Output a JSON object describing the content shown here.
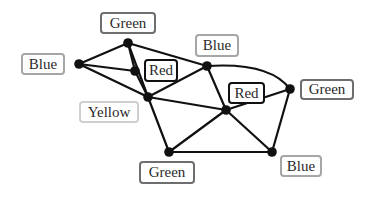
{
  "diagram": {
    "type": "graph-coloring",
    "colors": {
      "edge": "#111111",
      "node": "#111111",
      "border_red": "#111111",
      "border_green": "#6e6e6e",
      "border_blue": "#a6a6a6",
      "border_yellow": "#cfcfcf"
    },
    "nodes": [
      {
        "id": "A",
        "x": 79,
        "y": 64,
        "color": "Blue"
      },
      {
        "id": "B",
        "x": 128,
        "y": 43,
        "color": "Green"
      },
      {
        "id": "C",
        "x": 135,
        "y": 71,
        "color": "Red"
      },
      {
        "id": "D",
        "x": 148,
        "y": 97,
        "color": "Yellow"
      },
      {
        "id": "E",
        "x": 207,
        "y": 66,
        "color": "Blue"
      },
      {
        "id": "F",
        "x": 226,
        "y": 110,
        "color": "Red"
      },
      {
        "id": "G",
        "x": 290,
        "y": 89,
        "color": "Green"
      },
      {
        "id": "H",
        "x": 169,
        "y": 152,
        "color": "Green"
      },
      {
        "id": "I",
        "x": 272,
        "y": 152,
        "color": "Blue"
      }
    ],
    "edges": [
      [
        "A",
        "B"
      ],
      [
        "A",
        "C"
      ],
      [
        "A",
        "D"
      ],
      [
        "B",
        "C"
      ],
      [
        "B",
        "D"
      ],
      [
        "B",
        "E"
      ],
      [
        "C",
        "D"
      ],
      [
        "D",
        "E"
      ],
      [
        "D",
        "F"
      ],
      [
        "D",
        "H"
      ],
      [
        "E",
        "F"
      ],
      [
        "E",
        "G"
      ],
      [
        "F",
        "G"
      ],
      [
        "F",
        "H"
      ],
      [
        "F",
        "I"
      ],
      [
        "G",
        "I"
      ],
      [
        "H",
        "I"
      ]
    ],
    "labels": [
      {
        "node": "A",
        "text": "Blue",
        "x": 21,
        "y": 53,
        "w": 44,
        "h": 22,
        "border": "#a6a6a6",
        "bw": 2
      },
      {
        "node": "B",
        "text": "Green",
        "x": 100,
        "y": 12,
        "w": 56,
        "h": 22,
        "border": "#6e6e6e",
        "bw": 2
      },
      {
        "node": "C",
        "text": "Red",
        "x": 144,
        "y": 59,
        "w": 34,
        "h": 23,
        "border": "#111111",
        "bw": 2
      },
      {
        "node": "D",
        "text": "Yellow",
        "x": 79,
        "y": 101,
        "w": 60,
        "h": 22,
        "border": "#cfcfcf",
        "bw": 2
      },
      {
        "node": "E",
        "text": "Blue",
        "x": 195,
        "y": 34,
        "w": 44,
        "h": 23,
        "border": "#a6a6a6",
        "bw": 2
      },
      {
        "node": "F",
        "text": "Red",
        "x": 228,
        "y": 82,
        "w": 37,
        "h": 22,
        "border": "#111111",
        "bw": 2
      },
      {
        "node": "G",
        "text": "Green",
        "x": 300,
        "y": 79,
        "w": 54,
        "h": 21,
        "border": "#6e6e6e",
        "bw": 2
      },
      {
        "node": "H",
        "text": "Green",
        "x": 139,
        "y": 161,
        "w": 56,
        "h": 23,
        "border": "#6e6e6e",
        "bw": 2
      },
      {
        "node": "I",
        "text": "Blue",
        "x": 280,
        "y": 155,
        "w": 42,
        "h": 22,
        "border": "#a6a6a6",
        "bw": 2
      }
    ],
    "curved_edges": {
      "E-G": {
        "cx": 270,
        "cy": 62
      }
    }
  }
}
